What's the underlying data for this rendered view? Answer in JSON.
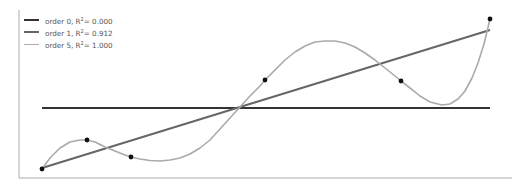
{
  "chart_data": {
    "type": "line",
    "title": "",
    "xlabel": "",
    "ylabel": "",
    "grid": false,
    "legend_position": "upper left",
    "axes": {
      "show_ticks": false,
      "spines": [
        "left",
        "bottom"
      ]
    },
    "scatter_points": {
      "x": [
        0.0,
        1.0,
        2.0,
        5.0,
        8.0,
        10.0
      ],
      "y": [
        0.54,
        2.26,
        1.25,
        5.83,
        5.77,
        9.46
      ]
    },
    "series": [
      {
        "name": "order 0",
        "r2": "0.000",
        "color": "#333333",
        "width": 2.0,
        "description": "constant fit",
        "y_const": 4.185
      },
      {
        "name": "order 1",
        "r2": "0.912",
        "color": "#666666",
        "width": 2.0,
        "description": "linear fit",
        "x": [
          0,
          10
        ],
        "y": [
          0.55,
          8.8
        ]
      },
      {
        "name": "order 5",
        "r2": "1.000",
        "color": "#aaaaaa",
        "width": 1.6,
        "description": "quintic fit passing through all points"
      }
    ]
  },
  "legend": {
    "items": [
      {
        "prefix": "order 0, R",
        "sup": "2",
        "suffix": "= 0.000",
        "color": "#333333",
        "width": 2
      },
      {
        "prefix": "order 1, R",
        "sup": "2",
        "suffix": "= 0.912",
        "color": "#666666",
        "width": 2
      },
      {
        "prefix": "order 5, R",
        "sup": "2",
        "suffix": "= 1.000",
        "color": "#aaaaaa",
        "width": 1.6
      }
    ]
  },
  "render": {
    "spine_color": "#aaaaaa",
    "left_spine": {
      "x": 19,
      "y1": 10,
      "y2": 178
    },
    "bottom_spine": {
      "x1": 19,
      "x2": 512,
      "y": 178
    },
    "points_px": [
      [
        42,
        169
      ],
      [
        87,
        140
      ],
      [
        131,
        157
      ],
      [
        265,
        80
      ],
      [
        401,
        81
      ],
      [
        490,
        19
      ]
    ],
    "order0_px": [
      [
        42,
        108
      ],
      [
        490,
        108
      ]
    ],
    "order1_px": [
      [
        42,
        168
      ],
      [
        490,
        30
      ]
    ],
    "order5_px": [
      [
        42,
        169
      ],
      [
        50,
        158
      ],
      [
        60,
        148
      ],
      [
        70,
        142
      ],
      [
        80,
        140
      ],
      [
        87,
        140
      ],
      [
        95,
        142
      ],
      [
        105,
        147
      ],
      [
        115,
        151
      ],
      [
        125,
        155
      ],
      [
        131,
        157
      ],
      [
        140,
        159
      ],
      [
        150,
        160.5
      ],
      [
        160,
        161
      ],
      [
        170,
        160
      ],
      [
        180,
        158
      ],
      [
        190,
        154
      ],
      [
        200,
        148
      ],
      [
        210,
        140
      ],
      [
        220,
        129
      ],
      [
        230,
        118
      ],
      [
        240,
        107
      ],
      [
        250,
        96
      ],
      [
        260,
        86
      ],
      [
        265,
        80
      ],
      [
        275,
        70
      ],
      [
        285,
        60
      ],
      [
        295,
        52
      ],
      [
        305,
        46
      ],
      [
        315,
        42
      ],
      [
        325,
        41
      ],
      [
        335,
        41
      ],
      [
        345,
        43
      ],
      [
        355,
        47
      ],
      [
        365,
        53
      ],
      [
        375,
        60
      ],
      [
        385,
        68
      ],
      [
        395,
        76
      ],
      [
        401,
        81
      ],
      [
        410,
        88
      ],
      [
        420,
        96
      ],
      [
        430,
        102
      ],
      [
        442,
        105
      ],
      [
        450,
        104
      ],
      [
        458,
        99
      ],
      [
        465,
        91
      ],
      [
        472,
        78
      ],
      [
        478,
        63
      ],
      [
        484,
        44
      ],
      [
        490,
        19
      ]
    ]
  }
}
